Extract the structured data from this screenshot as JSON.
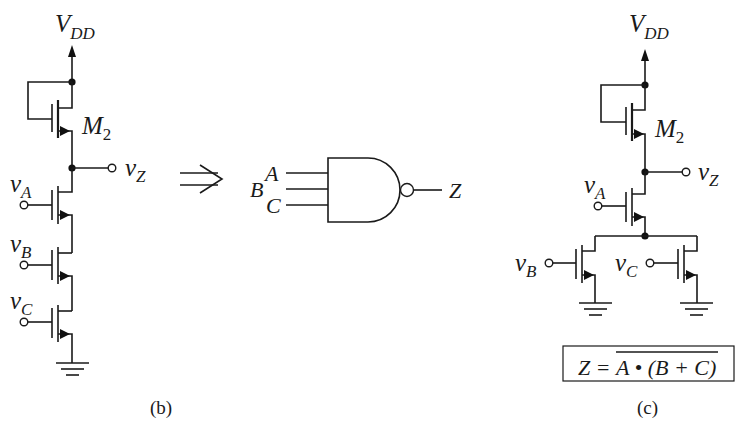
{
  "figure": {
    "panel_b": {
      "caption": "(b)",
      "supply": {
        "main": "V",
        "sub": "DD"
      },
      "load_transistor": {
        "main": "M",
        "sub": "2"
      },
      "output": {
        "main": "v",
        "sub": "Z"
      },
      "inputs": [
        {
          "main": "v",
          "sub": "A"
        },
        {
          "main": "v",
          "sub": "B"
        },
        {
          "main": "v",
          "sub": "C"
        }
      ],
      "topology": "series NMOS pull-down (A, B, C) with depletion load M2"
    },
    "equivalence_arrow": "⇒",
    "gate_symbol": {
      "type": "NAND",
      "inputs": [
        "A",
        "B",
        "C"
      ],
      "output": "Z"
    },
    "panel_c": {
      "caption": "(c)",
      "supply": {
        "main": "V",
        "sub": "DD"
      },
      "load_transistor": {
        "main": "M",
        "sub": "2"
      },
      "output": {
        "main": "v",
        "sub": "Z"
      },
      "inputs": [
        {
          "main": "v",
          "sub": "A"
        },
        {
          "main": "v",
          "sub": "B"
        },
        {
          "main": "v",
          "sub": "C"
        }
      ],
      "topology": "vA in series with parallel (vB || vC) pull-down, depletion load M2",
      "expression": {
        "lhs": "Z",
        "equals": "=",
        "rhs": "A • (B + C)",
        "negated": true
      }
    }
  }
}
